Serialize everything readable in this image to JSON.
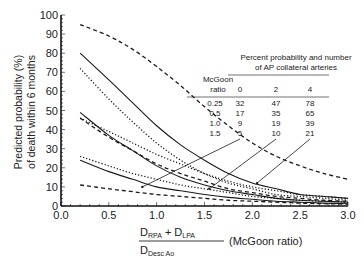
{
  "chart_data": {
    "type": "line",
    "title": "",
    "ylabel": "Predicted probability (%) of death within 6 months",
    "ylabel_lines": [
      "Predicted probability (%)",
      "of death within 6 months"
    ],
    "xlabel": {
      "numerator": "D_RPA + D_LPA",
      "numerator_parts": [
        "D",
        "RPA",
        " + D",
        "LPA"
      ],
      "denominator_parts": [
        "D",
        "Desc Ao"
      ],
      "suffix": "(McGoon ratio)"
    },
    "xlim": [
      0.0,
      3.0
    ],
    "ylim": [
      0,
      100
    ],
    "xticks": [
      "0.0",
      "0.5",
      "1.0",
      "1.5",
      "2.0",
      "2.5",
      "3.0"
    ],
    "yticks": [
      "0",
      "10",
      "20",
      "30",
      "40",
      "50",
      "60",
      "70",
      "80",
      "90",
      "100"
    ],
    "grid": false,
    "x": [
      0.2,
      0.5,
      0.75,
      1.0,
      1.25,
      1.5,
      1.75,
      2.0,
      2.25,
      2.5,
      2.75,
      3.0
    ],
    "series": [
      {
        "name": "4 AP collaterals (estimate)",
        "style": "solid",
        "values": [
          80,
          66,
          54,
          42,
          32,
          24,
          17,
          12,
          9,
          6,
          5,
          4
        ]
      },
      {
        "name": "4 AP collaterals (upper CI)",
        "style": "dashed",
        "values": [
          95,
          89,
          82,
          73,
          63,
          52,
          42,
          33,
          26,
          21,
          17,
          14
        ]
      },
      {
        "name": "4 AP collaterals (lower CI)",
        "style": "dotted",
        "values": [
          72,
          56,
          44,
          33,
          24,
          17,
          12,
          9,
          6,
          5,
          4,
          3
        ]
      },
      {
        "name": "2 AP collaterals (estimate)",
        "style": "solid",
        "values": [
          49,
          37,
          29,
          21,
          15,
          11,
          8,
          6,
          4,
          3,
          2.5,
          2
        ]
      },
      {
        "name": "2 AP collaterals (upper CI)",
        "style": "dotted",
        "values": [
          46,
          39,
          33,
          27,
          22,
          17,
          13,
          10,
          8,
          6,
          5,
          4
        ]
      },
      {
        "name": "2 AP collaterals (lower CI)",
        "style": "dashed",
        "values": [
          46,
          36,
          29,
          22,
          17,
          13,
          9,
          7,
          5,
          4,
          3,
          2.5
        ]
      },
      {
        "name": "0 AP collaterals (estimate)",
        "style": "solid",
        "values": [
          24,
          18,
          14,
          10,
          8,
          6,
          4.5,
          3.5,
          2.5,
          2,
          1.5,
          1.2
        ]
      },
      {
        "name": "0 AP collaterals (upper CI)",
        "style": "dotted",
        "values": [
          26,
          21,
          17,
          14,
          11,
          9,
          7,
          5,
          4,
          3,
          2.5,
          2
        ]
      },
      {
        "name": "0 AP collaterals (lower CI)",
        "style": "dashed",
        "values": [
          11,
          9,
          7.5,
          6,
          5,
          4,
          3,
          2.5,
          2,
          1.5,
          1.2,
          1
        ]
      }
    ],
    "annotations": [
      {
        "label": "5",
        "points_to_x": 0.85,
        "points_to_y": 10
      },
      {
        "label": "10",
        "points_to_x": 1.55,
        "points_to_y": 9
      },
      {
        "label": "21",
        "points_to_x": 2.05,
        "points_to_y": 12
      }
    ],
    "inset_table": {
      "title_lines": [
        "Percent probability and number",
        "of AP collateral arteries"
      ],
      "row_header_lines": [
        "McGoon",
        "ratio"
      ],
      "columns": [
        "0",
        "2",
        "4"
      ],
      "rows": [
        {
          "ratio": "0.25",
          "values": [
            "32",
            "47",
            "78"
          ]
        },
        {
          "ratio": "0.5",
          "values": [
            "17",
            "35",
            "65"
          ]
        },
        {
          "ratio": "1.0",
          "values": [
            "9",
            "19",
            "39"
          ]
        },
        {
          "ratio": "1.5",
          "values": [
            "5",
            "10",
            "21"
          ]
        }
      ]
    }
  }
}
